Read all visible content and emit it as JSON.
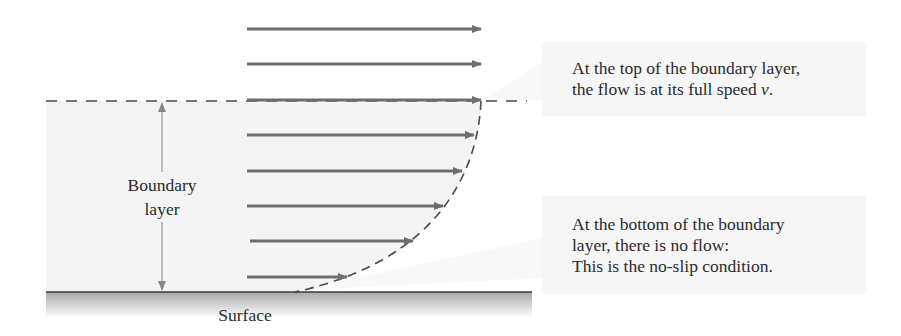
{
  "diagram": {
    "labels": {
      "boundary_layer_line1": "Boundary",
      "boundary_layer_line2": "layer",
      "surface": "Surface"
    },
    "callouts": [
      {
        "lines": [
          "At the top of the boundary layer,",
          "the flow is at its full speed "
        ],
        "symbol": "v",
        "symbol_suffix": "."
      },
      {
        "lines": [
          "At the bottom of the boundary",
          "layer, there is no flow:",
          "This is the no-slip condition."
        ]
      }
    ],
    "colors": {
      "arrow": "#6e6e6e",
      "dashed_line": "#4a4a4a",
      "layer_fill": "#f4f4f4",
      "callout_fill": "#f6f6f6",
      "surface_line": "#3a3a3a"
    },
    "flow_arrows": [
      {
        "y": 29,
        "x_start": 247,
        "x_end": 481
      },
      {
        "y": 64,
        "x_start": 247,
        "x_end": 481
      },
      {
        "y": 100,
        "x_start": 247,
        "x_end": 481
      },
      {
        "y": 135,
        "x_start": 247,
        "x_end": 474
      },
      {
        "y": 171,
        "x_start": 247,
        "x_end": 462
      },
      {
        "y": 206,
        "x_start": 247,
        "x_end": 443
      },
      {
        "y": 241,
        "x_start": 250,
        "x_end": 413
      },
      {
        "y": 277,
        "x_start": 247,
        "x_end": 347
      }
    ]
  }
}
